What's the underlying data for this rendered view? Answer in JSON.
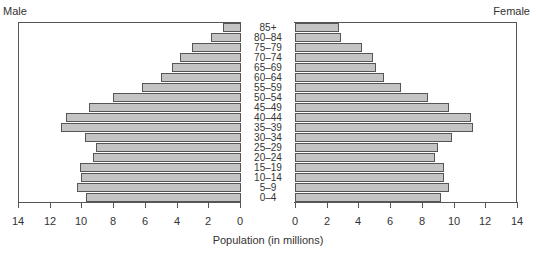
{
  "chart_data": {
    "type": "bar",
    "subtype": "population-pyramid",
    "title": "",
    "xlabel": "Population (in millions)",
    "ylabel": "",
    "left_panel_title": "Male",
    "right_panel_title": "Female",
    "categories": [
      "85+",
      "80–84",
      "75–79",
      "70–74",
      "65–69",
      "60–64",
      "55–59",
      "50–54",
      "45–49",
      "40–44",
      "35–39",
      "30–34",
      "25–29",
      "20–24",
      "15–19",
      "10–14",
      "5–9",
      "0–4"
    ],
    "series": [
      {
        "name": "Male",
        "values": [
          1.1,
          1.8,
          3.0,
          3.8,
          4.3,
          5.0,
          6.2,
          8.0,
          9.5,
          11.0,
          11.3,
          9.8,
          9.1,
          9.3,
          10.1,
          10.0,
          10.3,
          9.7
        ]
      },
      {
        "name": "Female",
        "values": [
          2.8,
          2.9,
          4.2,
          4.9,
          5.1,
          5.6,
          6.7,
          8.4,
          9.7,
          11.1,
          11.2,
          9.9,
          9.0,
          8.8,
          9.4,
          9.4,
          9.7,
          9.2
        ]
      }
    ],
    "xlim": [
      0,
      14
    ],
    "male_ticks": [
      "14",
      "12",
      "10",
      "8",
      "6",
      "4",
      "2",
      "0"
    ],
    "female_ticks": [
      "0",
      "2",
      "4",
      "6",
      "8",
      "10",
      "12",
      "14"
    ],
    "grid": false,
    "bar_color": "#c4c4c4",
    "bar_edge_color": "#555555"
  }
}
